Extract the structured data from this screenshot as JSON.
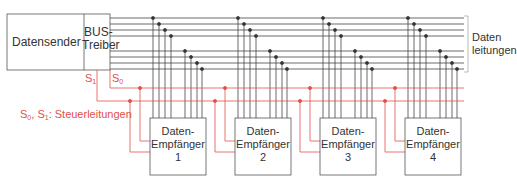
{
  "sender": {
    "label": "Datensender"
  },
  "driver": {
    "line1": "BUS-",
    "line2": "Treiber"
  },
  "control": {
    "s1": "S",
    "s1_sub": "1",
    "s0": "S",
    "s0_sub": "0",
    "legend_prefix_a": "S",
    "legend_sub_a": "0",
    "legend_sep": ", ",
    "legend_prefix_b": "S",
    "legend_sub_b": "1",
    "legend_text": ": Steuerleitungen"
  },
  "data_lines": {
    "line1": "Daten",
    "line2": "leitungen"
  },
  "receivers": [
    {
      "line1": "Daten-",
      "line2": "Empfänger",
      "number": "1"
    },
    {
      "line1": "Daten-",
      "line2": "Empfänger",
      "number": "2"
    },
    {
      "line1": "Daten-",
      "line2": "Empfänger",
      "number": "3"
    },
    {
      "line1": "Daten-",
      "line2": "Empfänger",
      "number": "4"
    }
  ],
  "colors": {
    "bus": "#333333",
    "control": "#e0504a",
    "box": "#555555"
  }
}
